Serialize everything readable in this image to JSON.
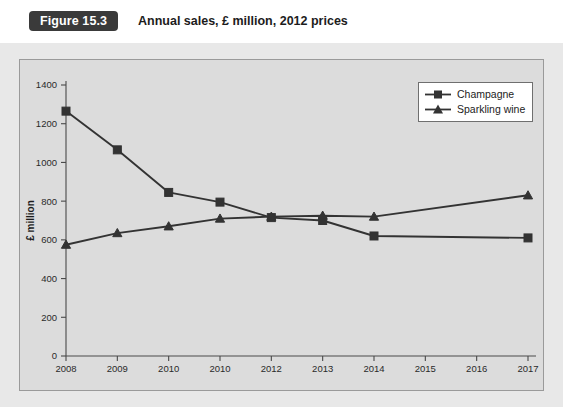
{
  "header": {
    "badge": "Figure 15.3",
    "title": "Annual sales, £ million, 2012 prices"
  },
  "legend": {
    "items": [
      {
        "label": "Champagne",
        "marker": "square-marker-icon"
      },
      {
        "label": "Sparkling wine",
        "marker": "triangle-marker-icon"
      }
    ]
  },
  "chart_data": {
    "type": "line",
    "title": "Annual sales, £ million, 2012 prices",
    "xlabel": "",
    "ylabel": "£ million",
    "ylim": [
      0,
      1400
    ],
    "ytick_step": 200,
    "yticks": [
      0,
      200,
      400,
      600,
      800,
      1000,
      1200,
      1400
    ],
    "categories": [
      "2008",
      "2009",
      "2010",
      "2010",
      "2012",
      "2013",
      "2014",
      "2015",
      "2016",
      "2017"
    ],
    "grid": false,
    "legend_position": "top-right",
    "series": [
      {
        "name": "Champagne",
        "marker": "square",
        "values": [
          1265,
          1065,
          845,
          795,
          715,
          700,
          620,
          null,
          null,
          610
        ]
      },
      {
        "name": "Sparkling wine",
        "marker": "triangle",
        "values": [
          575,
          635,
          670,
          710,
          720,
          725,
          720,
          null,
          null,
          830
        ]
      }
    ]
  }
}
